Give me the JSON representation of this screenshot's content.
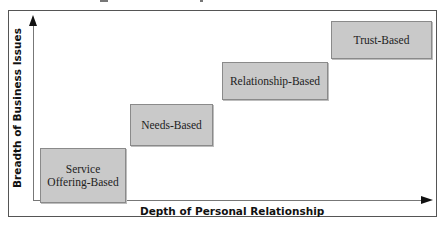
{
  "diagram": {
    "type": "staircase-quadrant",
    "y_axis_label": "Breadth of Business Issues",
    "x_axis_label": "Depth of Personal Relationship",
    "stages": [
      {
        "label": "Service Offering-Based",
        "line1": "Service",
        "line2": "Offering-Based"
      },
      {
        "label": "Needs-Based"
      },
      {
        "label": "Relationship-Based"
      },
      {
        "label": "Trust-Based"
      }
    ],
    "colors": {
      "box_fill": "#c9c9c9",
      "box_border": "#8a8a8a",
      "axis": "#777777",
      "arrowhead": "#111111",
      "frame": "#555555"
    }
  }
}
